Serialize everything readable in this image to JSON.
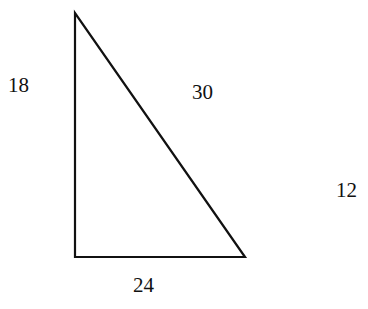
{
  "diagram": {
    "type": "right-triangle",
    "vertices": {
      "top": [
        75,
        13
      ],
      "bottom_left": [
        75,
        257
      ],
      "bottom_right": [
        245,
        257
      ]
    },
    "labels": {
      "left_side": "18",
      "hypotenuse": "30",
      "bottom_side": "24",
      "right_free": "12"
    },
    "stroke_color": "#111111",
    "background": "#ffffff"
  }
}
